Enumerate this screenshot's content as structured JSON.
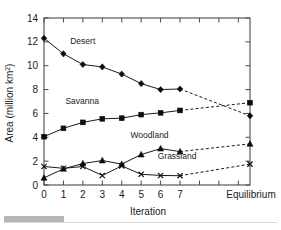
{
  "chart_data": {
    "type": "line",
    "title": "",
    "xlabel": "Iteration",
    "ylabel": "Area (million km2)",
    "ylabel_display": "Area (million km²)",
    "xlim": [
      0,
      10.6
    ],
    "ylim": [
      0,
      14
    ],
    "yticks": [
      0,
      2,
      4,
      6,
      8,
      10,
      12,
      14
    ],
    "ytick_labels": [
      "0",
      "2",
      "4",
      "6",
      "8",
      "10",
      "12",
      "14"
    ],
    "xticks": [
      0,
      1,
      2,
      3,
      4,
      5,
      6,
      7,
      10.6
    ],
    "xtick_labels": [
      "0",
      "1",
      "2",
      "3",
      "4",
      "5",
      "6",
      "7",
      "Equilibrium"
    ],
    "grid": false,
    "legend": "inline-annotations",
    "x": [
      0,
      1,
      2,
      3,
      4,
      5,
      6,
      7,
      10.6
    ],
    "series": [
      {
        "name": "Desert",
        "marker": "diamond",
        "values": [
          12.3,
          11.0,
          10.1,
          9.9,
          9.3,
          8.5,
          8.0,
          8.05,
          5.8
        ],
        "solid_through_index": 7,
        "label_x": 1.35,
        "label_y": 11.85
      },
      {
        "name": "Savanna",
        "marker": "square",
        "values": [
          4.05,
          4.75,
          5.25,
          5.55,
          5.6,
          5.9,
          6.05,
          6.25,
          6.9
        ],
        "solid_through_index": 7,
        "label_x": 1.1,
        "label_y": 6.75
      },
      {
        "name": "Woodland",
        "marker": "triangle",
        "values": [
          0.6,
          1.35,
          1.8,
          2.05,
          1.75,
          2.55,
          3.05,
          2.8,
          3.45
        ],
        "solid_through_index": 7,
        "label_x": 4.45,
        "label_y": 3.95
      },
      {
        "name": "Grassland",
        "marker": "cross",
        "values": [
          1.55,
          1.4,
          1.55,
          0.8,
          1.6,
          0.9,
          0.8,
          0.78,
          1.75
        ],
        "solid_through_index": 7,
        "label_x": 5.85,
        "label_y": 2.15
      }
    ]
  },
  "axes": {
    "x_title": "Iteration",
    "y_title_main": "Area (million km",
    "y_title_sup": "2",
    "y_title_close": ")"
  }
}
